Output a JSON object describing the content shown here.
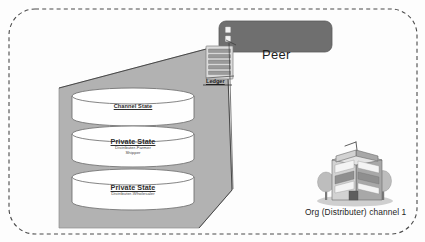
{
  "diagram": {
    "colors": {
      "prism_fill": "#b2b2b2",
      "peer_fill": "#6f6f6f",
      "boundary_stroke": "#4a4a4a",
      "cylinder_fill": "#fefefe",
      "ledger_card_fill": "#dcdcdc"
    }
  },
  "channel": {
    "boundary_name": "channel-boundary",
    "caption": "Org (Distributer)  channel 1",
    "org_label": "Org (Distributer)",
    "channel_label": "channel 1"
  },
  "peer": {
    "label": "Peer"
  },
  "ledger": {
    "label": "Ledger",
    "block_rows": 5
  },
  "world_state": {
    "container_name": "world-state-prism",
    "stores": [
      {
        "id": "channel-state",
        "title": "Channel State",
        "underlined": false,
        "subtitle_lines": []
      },
      {
        "id": "private-state-farmer-shipper",
        "title": "Private State",
        "underlined": true,
        "subtitle_lines": [
          "Distributer-Farmer",
          "Shipper"
        ]
      },
      {
        "id": "private-state-wholesaler",
        "title": "Private State",
        "underlined": true,
        "subtitle_lines": [
          "Distributer-Wholesaler"
        ]
      }
    ]
  },
  "org": {
    "icon_name": "office-building-icon",
    "caption": "Org (Distributer)  channel 1"
  }
}
